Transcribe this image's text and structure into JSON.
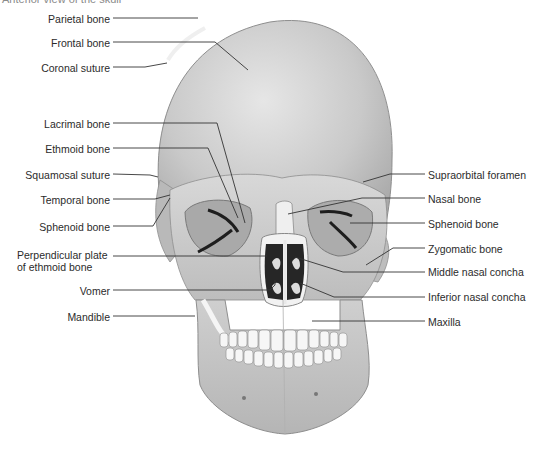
{
  "caption": "Anterior view of the skull",
  "figure": {
    "left_labels": [
      {
        "id": "parietal-bone",
        "text": "Parietal bone",
        "x": 110,
        "y": 13
      },
      {
        "id": "frontal-bone",
        "text": "Frontal bone",
        "x": 110,
        "y": 37
      },
      {
        "id": "coronal-suture",
        "text": "Coronal suture",
        "x": 110,
        "y": 63
      },
      {
        "id": "lacrimal-bone",
        "text": "Lacrimal bone",
        "x": 110,
        "y": 118
      },
      {
        "id": "ethmoid-bone",
        "text": "Ethmoid bone",
        "x": 110,
        "y": 143
      },
      {
        "id": "squamosal-suture",
        "text": "Squamosal suture",
        "x": 110,
        "y": 170
      },
      {
        "id": "temporal-bone",
        "text": "Temporal bone",
        "x": 110,
        "y": 195
      },
      {
        "id": "sphenoid-bone-left",
        "text": "Sphenoid bone",
        "x": 110,
        "y": 222
      },
      {
        "id": "perpendicular-plate",
        "text": "Perpendicular plate",
        "x": 110,
        "y": 249
      },
      {
        "id": "perpendicular-plate-2",
        "text": "of ethmoid bone",
        "x": 110,
        "y": 262
      },
      {
        "id": "vomer",
        "text": "Vomer",
        "x": 110,
        "y": 285
      },
      {
        "id": "mandible",
        "text": "Mandible",
        "x": 110,
        "y": 312
      }
    ],
    "right_labels": [
      {
        "id": "supraorbital-foramen",
        "text": "Supraorbital foramen",
        "x": 428,
        "y": 170
      },
      {
        "id": "nasal-bone",
        "text": "Nasal bone",
        "x": 428,
        "y": 194
      },
      {
        "id": "sphenoid-bone-right",
        "text": "Sphenoid bone",
        "x": 428,
        "y": 219
      },
      {
        "id": "zygomatic-bone",
        "text": "Zygomatic bone",
        "x": 428,
        "y": 244
      },
      {
        "id": "middle-nasal-concha",
        "text": "Middle nasal concha",
        "x": 428,
        "y": 267
      },
      {
        "id": "inferior-nasal-concha",
        "text": "Inferior nasal concha",
        "x": 428,
        "y": 292
      },
      {
        "id": "maxilla",
        "text": "Maxilla",
        "x": 428,
        "y": 317
      }
    ]
  },
  "colors": {
    "bone_light": "#f0f0f0",
    "bone_mid": "#c8c8c8",
    "bone_dark": "#9a9a9a",
    "cavity": "#2a2a2a",
    "leader_line": "#333333",
    "label_text": "#2b2b2b"
  }
}
